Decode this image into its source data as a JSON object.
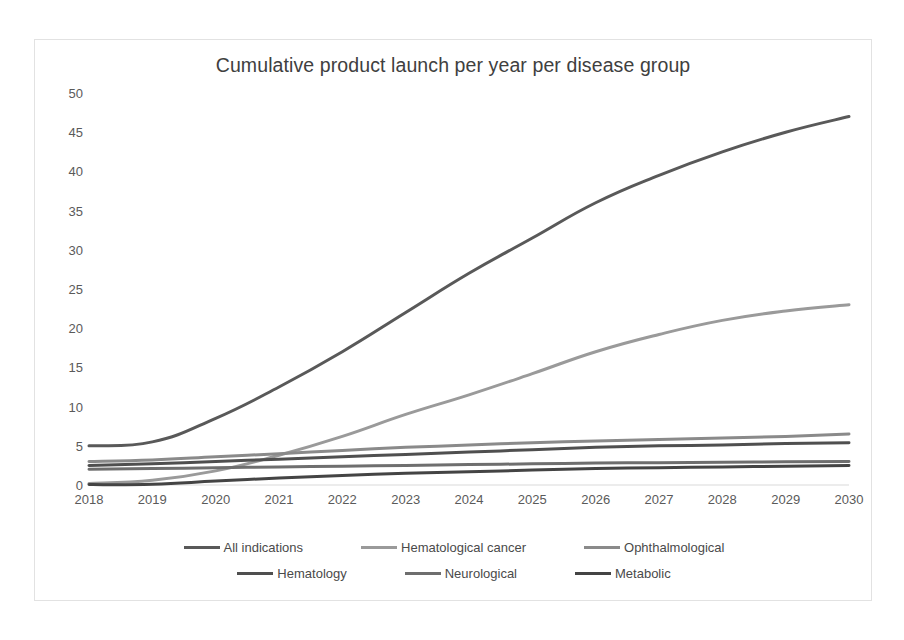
{
  "chart_data": {
    "type": "line",
    "title": "Cumulative product launch per year per disease group",
    "xlabel": "",
    "ylabel": "",
    "x": [
      2018,
      2019,
      2020,
      2021,
      2022,
      2023,
      2024,
      2025,
      2026,
      2027,
      2028,
      2029,
      2030
    ],
    "categories": [
      "2018",
      "2019",
      "2020",
      "2021",
      "2022",
      "2023",
      "2024",
      "2025",
      "2026",
      "2027",
      "2028",
      "2029",
      "2030"
    ],
    "xlim": [
      2018,
      2030
    ],
    "ylim": [
      0,
      50
    ],
    "y_ticks": [
      0,
      5,
      10,
      15,
      20,
      25,
      30,
      35,
      40,
      45,
      50
    ],
    "grid": false,
    "legend_position": "bottom",
    "series": [
      {
        "name": "All indications",
        "color": "#595959",
        "values": [
          5.0,
          5.5,
          8.5,
          12.5,
          17.0,
          22.0,
          27.0,
          31.5,
          36.0,
          39.5,
          42.5,
          45.0,
          47.0
        ]
      },
      {
        "name": "Hematological cancer",
        "color": "#9a9a9a",
        "values": [
          0.2,
          0.6,
          1.8,
          3.8,
          6.2,
          9.0,
          11.5,
          14.2,
          17.0,
          19.2,
          21.0,
          22.2,
          23.0
        ]
      },
      {
        "name": "Ophthalmological",
        "color": "#8a8a8a",
        "values": [
          3.0,
          3.2,
          3.6,
          4.0,
          4.4,
          4.8,
          5.1,
          5.4,
          5.6,
          5.8,
          6.0,
          6.2,
          6.5
        ]
      },
      {
        "name": "Hematology",
        "color": "#4f4f4f",
        "values": [
          2.5,
          2.7,
          3.0,
          3.3,
          3.6,
          3.9,
          4.2,
          4.5,
          4.8,
          5.0,
          5.1,
          5.3,
          5.4
        ]
      },
      {
        "name": "Neurological",
        "color": "#6e6e6e",
        "values": [
          2.0,
          2.1,
          2.2,
          2.3,
          2.4,
          2.5,
          2.6,
          2.7,
          2.8,
          2.85,
          2.9,
          2.95,
          3.0
        ]
      },
      {
        "name": "Metabolic",
        "color": "#444444",
        "values": [
          0.05,
          0.1,
          0.5,
          0.9,
          1.2,
          1.5,
          1.7,
          1.9,
          2.1,
          2.2,
          2.3,
          2.4,
          2.5
        ]
      }
    ]
  },
  "legend": {
    "rows": [
      [
        {
          "label": "All indications",
          "color": "#595959"
        },
        {
          "label": "Hematological cancer",
          "color": "#9a9a9a"
        },
        {
          "label": "Ophthalmological",
          "color": "#8a8a8a"
        }
      ],
      [
        {
          "label": "Hematology",
          "color": "#4f4f4f"
        },
        {
          "label": "Neurological",
          "color": "#6e6e6e"
        },
        {
          "label": "Metabolic",
          "color": "#444444"
        }
      ]
    ]
  },
  "style": {
    "axis_line_color": "#d9d9d9",
    "frame_color": "#e2e2e2",
    "background": "#ffffff",
    "text_color": "#5a5a5a"
  }
}
